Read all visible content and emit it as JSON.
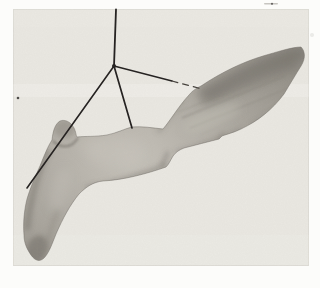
{
  "image": {
    "kind": "black-and-white halftone photograph",
    "subject": "smooth carved wooden object with a rounded knob, a down-curving leg, and a long tapering blade, hanging in front of a plain light backdrop",
    "suspension": "three strings (left, middle, right) converge at a knot joined to one vertical cord from the top edge; the right string is thin and appears broken/dashed",
    "marks": "small dark dust speck at left edge, faint printing smudges at top right"
  },
  "colors": {
    "page_bg": "#fcfcfa",
    "photo_bg": "#e9e7e1",
    "photo_band": "#f1efe9",
    "photo_edge": "#dedcd6",
    "string": "#242120",
    "string_faint": "#45413c",
    "object_light": "#c6c2ba",
    "object_mid": "#a7a39b",
    "object_dark": "#8a867e",
    "object_deep": "#6e6a63",
    "speck_dark": "#4e4b48",
    "speck_faint": "#b9b6b1"
  }
}
